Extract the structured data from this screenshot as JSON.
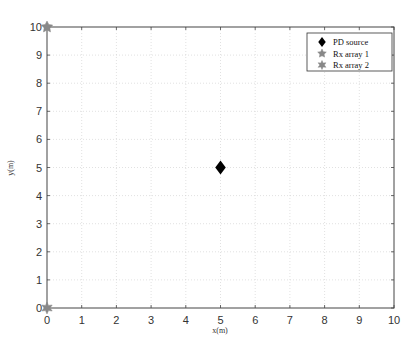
{
  "chart_data": {
    "type": "scatter",
    "title": "",
    "xlabel": "x(m)",
    "ylabel": "y(m)",
    "xlim": [
      0,
      10
    ],
    "ylim": [
      0,
      10
    ],
    "xticks": [
      0,
      1,
      2,
      3,
      4,
      5,
      6,
      7,
      8,
      9,
      10
    ],
    "yticks": [
      0,
      1,
      2,
      3,
      4,
      5,
      6,
      7,
      8,
      9,
      10
    ],
    "grid": true,
    "legend_position": "upper right",
    "series": [
      {
        "name": "PD source",
        "marker": "diamond",
        "color": "#000000",
        "points": [
          [
            5,
            5
          ]
        ]
      },
      {
        "name": "Rx array 1",
        "marker": "pentagram",
        "color": "#888888",
        "points": [
          [
            0,
            10
          ]
        ]
      },
      {
        "name": "Rx array 2",
        "marker": "hexagram",
        "color": "#888888",
        "points": [
          [
            0,
            0
          ]
        ]
      }
    ]
  },
  "legend": {
    "items": [
      "PD source",
      "Rx array 1",
      "Rx array 2"
    ]
  }
}
